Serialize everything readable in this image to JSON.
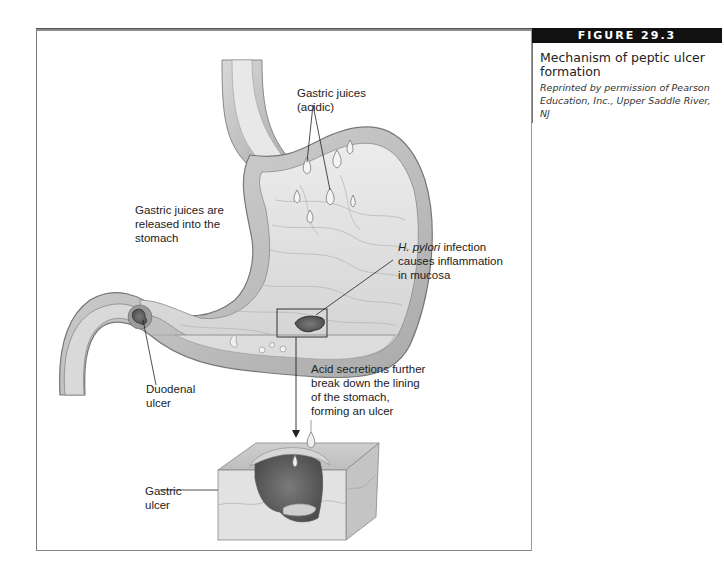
{
  "figure": {
    "number_label": "FIGURE 29.3",
    "title": "Mechanism of peptic ulcer formation",
    "credit": "Reprinted by permission of Pearson Education, Inc., Upper Saddle River, NJ"
  },
  "illustration": {
    "subject": "stomach-cross-section-with-peptic-ulcer",
    "labels": {
      "gastric_juices_acidic": [
        "Gastric juices",
        "(acidic)"
      ],
      "gastric_juices_released": [
        "Gastric juices are",
        "released into the",
        "stomach"
      ],
      "h_pylori_italic": "H. pylori",
      "h_pylori_rest": " infection",
      "h_pylori_lines": [
        "causes inflammation",
        "in mucosa"
      ],
      "acid_secretions": [
        "Acid secretions further",
        "break down the lining",
        "of the stomach,",
        "forming an ulcer"
      ],
      "duodenal_ulcer": [
        "Duodenal",
        "ulcer"
      ],
      "gastric_ulcer": [
        "Gastric",
        "ulcer"
      ]
    }
  },
  "colors": {
    "header_bar": "#8c8c8c",
    "figure_label_bg": "#111111",
    "tissue_light": "#e4e4e4",
    "tissue_mid": "#c8c8c8",
    "tissue_dark": "#6f6f6f"
  }
}
